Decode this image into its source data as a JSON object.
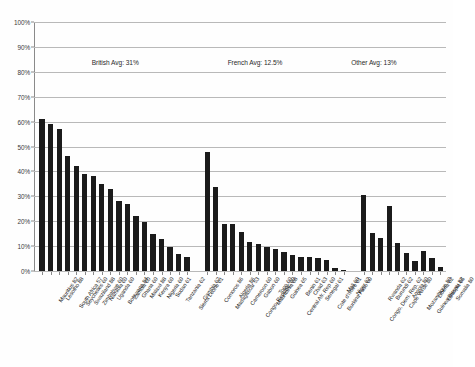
{
  "chart_data": {
    "type": "bar",
    "title": "",
    "subtitle": "",
    "xlabel": "",
    "ylabel": "",
    "ylim": [
      0,
      100
    ],
    "ytick_labels": [
      "0%",
      "10%",
      "20%",
      "30%",
      "40%",
      "50%",
      "60%",
      "70%",
      "80%",
      "90%",
      "100%"
    ],
    "ytick_values": [
      0,
      10,
      20,
      30,
      40,
      50,
      60,
      70,
      80,
      90,
      100
    ],
    "grid": true,
    "legend": "none",
    "bar_color": "#1b1b1b",
    "axis_color": "#8a8a8a",
    "grid_color": "#b9b9b9",
    "categories": [
      "Mauritius 82",
      "Lesotho 88",
      "South Africa 57",
      "Seychelles 60",
      "Swaziland 88",
      "Zimbabwe 60",
      "Namibia 60",
      "Uganda 60",
      "Botswana 84",
      "Zambia 60",
      "Ghana 60",
      "Malawi 88",
      "Kenya 60",
      "Nigeria 60",
      "Sudan 61",
      "Tanzania 62",
      "Sierra Leone 61",
      "Gambia 62",
      "Comoros 86",
      "Madagascar 53",
      "Algeria 86",
      "Cameroon 60",
      "Congo, Republic 60",
      "Gabon 60",
      "Mauritania 68",
      "Togo 60",
      "Guinea 65",
      "Central Afr. Rep 60",
      "Benin 61",
      "Chad 63",
      "Senegal 61",
      "Cote d'Ivoire 61",
      "Burkina Faso 60",
      "Mali 60",
      "Niger 62",
      "Congo, Dem. Rep. 62",
      "Rwanda 62",
      "Burundi 62",
      "Cape Verde 80",
      "Angola 80",
      "Mozambique 80",
      "Guinea-Bissau 82",
      "Liberia 62",
      "Ethiopia 65",
      "Somalia 80"
    ],
    "values": [
      61.0,
      59.0,
      57.0,
      46.0,
      42.0,
      39.0,
      38.0,
      35.0,
      32.8,
      28.0,
      27.0,
      22.0,
      19.7,
      15.0,
      13.0,
      9.8,
      6.8,
      5.8,
      47.6,
      33.8,
      19.0,
      18.8,
      15.6,
      11.5,
      10.7,
      9.7,
      9.0,
      7.8,
      6.5,
      5.6,
      5.6,
      5.4,
      4.5,
      1.4,
      0.6,
      30.5,
      15.4,
      13.3,
      26.3,
      11.2,
      7.1,
      4.2,
      8.2,
      5.1,
      1.5
    ],
    "groups": [
      {
        "name": "British",
        "start_index": 0,
        "count": 18
      },
      {
        "name": "French",
        "start_index": 18,
        "count": 17
      },
      {
        "name": "Other",
        "start_index": 35,
        "count": 10
      }
    ],
    "annotations": [
      {
        "text": "British Avg: 31%",
        "x_frac": 0.14,
        "y_value": 85
      },
      {
        "text": "French Avg: 12.5%",
        "x_frac": 0.47,
        "y_value": 85
      },
      {
        "text": "Other Avg: 13%",
        "x_frac": 0.77,
        "y_value": 85
      }
    ]
  }
}
